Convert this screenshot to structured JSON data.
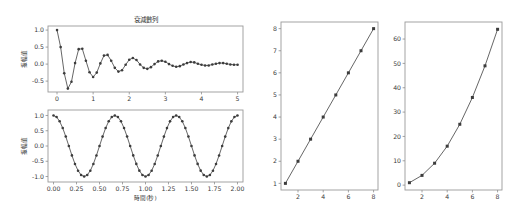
{
  "figure": {
    "background_color": "#ffffff",
    "line_color": "#4a4a4a",
    "marker_color": "#3c3c3c",
    "spine_color": "#9a9a9a",
    "width": 527,
    "height": 216
  },
  "chart_data": [
    {
      "id": "damped-sequence",
      "type": "line",
      "title": "衰減數列",
      "xlabel": "",
      "ylabel": "振幅值",
      "xlim": [
        -0.25,
        5.15
      ],
      "ylim": [
        -0.82,
        1.12
      ],
      "xticks": [
        0,
        1,
        2,
        3,
        4,
        5
      ],
      "xtick_labels": [
        "0",
        "1",
        "2",
        "3",
        "4",
        "5"
      ],
      "yticks": [
        -0.5,
        0.0,
        0.5,
        1.0
      ],
      "ytick_labels": [
        "-0.5",
        "0.0",
        "0.5",
        "1.0"
      ],
      "grid": false,
      "legend": null,
      "marker": "circle",
      "x": [
        0.0,
        0.1,
        0.2,
        0.3,
        0.4,
        0.5,
        0.6,
        0.7,
        0.8,
        0.9,
        1.0,
        1.1,
        1.2,
        1.3,
        1.4,
        1.5,
        1.6,
        1.7,
        1.8,
        1.9,
        2.0,
        2.1,
        2.2,
        2.3,
        2.4,
        2.5,
        2.6,
        2.7,
        2.8,
        2.9,
        3.0,
        3.1,
        3.2,
        3.3,
        3.4,
        3.5,
        3.6,
        3.7,
        3.8,
        3.9,
        4.0,
        4.1,
        4.2,
        4.3,
        4.4,
        4.5,
        4.6,
        4.7,
        4.8,
        4.9,
        5.0
      ],
      "values": [
        1.0,
        0.5,
        -0.27,
        -0.72,
        -0.52,
        0.03,
        0.44,
        0.45,
        0.1,
        -0.24,
        -0.38,
        -0.25,
        0.02,
        0.25,
        0.27,
        0.1,
        -0.11,
        -0.22,
        -0.18,
        -0.02,
        0.13,
        0.18,
        0.12,
        -0.01,
        -0.11,
        -0.14,
        -0.09,
        0.0,
        0.08,
        0.1,
        0.07,
        0.0,
        -0.05,
        -0.08,
        -0.06,
        -0.01,
        0.03,
        0.06,
        0.05,
        0.01,
        -0.02,
        -0.04,
        -0.04,
        -0.01,
        0.01,
        0.03,
        0.03,
        0.01,
        -0.01,
        -0.02,
        -0.02
      ]
    },
    {
      "id": "cosine-wave",
      "type": "line",
      "title": "",
      "xlabel": "時間(秒)",
      "ylabel": "振幅值",
      "xlim": [
        -0.06,
        2.06
      ],
      "ylim": [
        -1.18,
        1.18
      ],
      "xticks": [
        0.0,
        0.25,
        0.5,
        0.75,
        1.0,
        1.25,
        1.5,
        1.75,
        2.0
      ],
      "xtick_labels": [
        "0.00",
        "0.25",
        "0.50",
        "0.75",
        "1.00",
        "1.25",
        "1.50",
        "1.75",
        "2.00"
      ],
      "yticks": [
        -1.0,
        -0.5,
        0.0,
        0.5,
        1.0
      ],
      "ytick_labels": [
        "-1.0",
        "-0.5",
        "0.0",
        "0.5",
        "1.0"
      ],
      "grid": false,
      "legend": null,
      "marker": "circle",
      "period": 0.6667,
      "amplitude": 1.0,
      "function": "cos(2*pi*1.5*t)",
      "n_points": 61
    },
    {
      "id": "linear-series",
      "type": "line",
      "title": "",
      "xlabel": "",
      "ylabel": "",
      "xlim": [
        0.65,
        8.35
      ],
      "ylim": [
        0.7,
        8.3
      ],
      "xticks": [
        2,
        4,
        6,
        8
      ],
      "xtick_labels": [
        "2",
        "4",
        "6",
        "8"
      ],
      "yticks": [
        1,
        2,
        3,
        4,
        5,
        6,
        7,
        8
      ],
      "ytick_labels": [
        "1",
        "2",
        "3",
        "4",
        "5",
        "6",
        "7",
        "8"
      ],
      "grid": false,
      "legend": null,
      "marker": "square",
      "x": [
        1,
        2,
        3,
        4,
        5,
        6,
        7,
        8
      ],
      "values": [
        1,
        2,
        3,
        4,
        5,
        6,
        7,
        8
      ]
    },
    {
      "id": "quadratic-series",
      "type": "line",
      "title": "",
      "xlabel": "",
      "ylabel": "",
      "xlim": [
        0.65,
        8.35
      ],
      "ylim": [
        -2.0,
        67.0
      ],
      "xticks": [
        2,
        4,
        6,
        8
      ],
      "xtick_labels": [
        "2",
        "4",
        "6",
        "8"
      ],
      "yticks": [
        0,
        10,
        20,
        30,
        40,
        50,
        60
      ],
      "ytick_labels": [
        "0",
        "10",
        "20",
        "30",
        "40",
        "50",
        "60"
      ],
      "grid": false,
      "legend": null,
      "marker": "square",
      "x": [
        1,
        2,
        3,
        4,
        5,
        6,
        7,
        8
      ],
      "values": [
        1,
        4,
        9,
        16,
        25,
        36,
        49,
        64
      ]
    }
  ]
}
